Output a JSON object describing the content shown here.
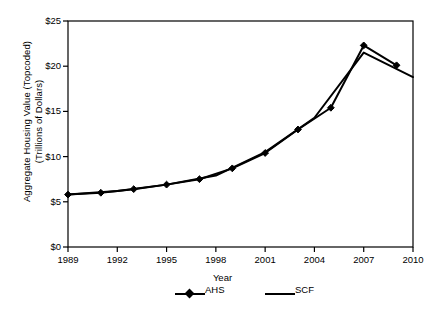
{
  "chart_data": {
    "type": "line",
    "title": "",
    "xlabel": "Year",
    "ylabel": "Aggregate Housing Value (Topcoded) (Trillions of Dollars)",
    "ylabel_lines": [
      "Aggregate Housing Value (Topcoded)",
      "(Trillions of Dollars)"
    ],
    "xlim": [
      1989,
      2010
    ],
    "ylim": [
      0,
      25
    ],
    "xticks": [
      1989,
      1992,
      1995,
      1998,
      2001,
      2004,
      2007,
      2010
    ],
    "xtick_labels": [
      "1989",
      "1992",
      "1995",
      "1998",
      "2001",
      "2004",
      "2007",
      "2010"
    ],
    "yticks": [
      0,
      5,
      10,
      15,
      20,
      25
    ],
    "ytick_labels": [
      "$0",
      "$5",
      "$10",
      "$15",
      "$20",
      "$25"
    ],
    "grid": false,
    "legend_position": "bottom",
    "series": [
      {
        "name": "AHS",
        "marker": "diamond",
        "color": "#000000",
        "x": [
          1989,
          1991,
          1993,
          1995,
          1997,
          1999,
          2001,
          2003,
          2005,
          2007,
          2009
        ],
        "values": [
          5.8,
          6.0,
          6.4,
          6.9,
          7.5,
          8.7,
          10.4,
          13.0,
          15.4,
          22.3,
          20.1
        ]
      },
      {
        "name": "SCF",
        "marker": "none",
        "color": "#000000",
        "x": [
          1989,
          1992,
          1995,
          1998,
          2001,
          2004,
          2007,
          2010
        ],
        "values": [
          5.8,
          6.2,
          6.9,
          7.9,
          10.5,
          14.3,
          21.5,
          18.8
        ]
      }
    ]
  },
  "legend": {
    "entries": [
      {
        "label": "AHS"
      },
      {
        "label": "SCF"
      }
    ]
  },
  "axis": {
    "x_title": "Year"
  }
}
